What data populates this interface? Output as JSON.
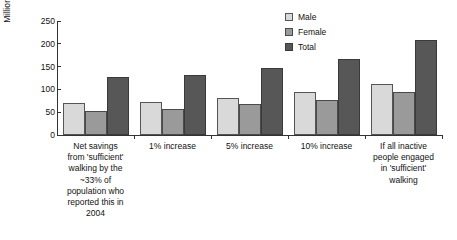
{
  "chart_data": {
    "type": "bar",
    "title": "",
    "xlabel": "",
    "ylabel": "Million AU$",
    "ylim": [
      0,
      250
    ],
    "yticks": [
      0,
      50,
      100,
      150,
      200,
      250
    ],
    "grid": false,
    "legend_position": "top-right",
    "categories": [
      "Net savings from 'sufficient' walking by the ~33% of population who reported this in 2004",
      "1% increase",
      "5% increase",
      "10% increase",
      "If all inactive people engaged in 'sufficient' walking"
    ],
    "category_lines": [
      [
        "Net savings",
        "from 'sufficient'",
        "walking by the",
        "~33% of",
        "population who",
        "reported this in",
        "2004"
      ],
      [
        "1% increase"
      ],
      [
        "5% increase"
      ],
      [
        "10% increase"
      ],
      [
        "If all inactive",
        "people engaged",
        "in 'sufficient'",
        "walking"
      ]
    ],
    "series": [
      {
        "name": "Male",
        "color": "#d9d9d9",
        "values": [
          70,
          73,
          82,
          95,
          112
        ]
      },
      {
        "name": "Female",
        "color": "#9a9a9a",
        "values": [
          53,
          56,
          67,
          77,
          95
        ]
      },
      {
        "name": "Total",
        "color": "#575757",
        "values": [
          127,
          131,
          148,
          167,
          209
        ]
      }
    ]
  },
  "legend": {
    "items": [
      {
        "label": "Male"
      },
      {
        "label": "Female"
      },
      {
        "label": "Total"
      }
    ]
  },
  "axis": {
    "y_title": "Million AU$",
    "y_tick_labels": [
      "250",
      "200",
      "150",
      "100",
      "50",
      "0"
    ]
  }
}
